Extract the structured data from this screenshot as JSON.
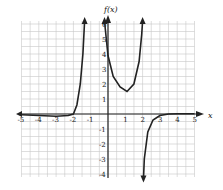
{
  "chart_data": {
    "type": "line",
    "title": "",
    "xlabel": "x",
    "ylabel": "f(x)",
    "xlim": [
      -5,
      5
    ],
    "ylim": [
      -4,
      6
    ],
    "grid": true,
    "x_ticks": [
      "-5",
      "-4",
      "-3",
      "-2",
      "-1",
      "1",
      "2",
      "3",
      "4",
      "5"
    ],
    "y_ticks": [
      "6",
      "5",
      "4",
      "3",
      "2",
      "1",
      "-1",
      "-2",
      "-3",
      "-4"
    ],
    "vertical_asymptotes": [
      -1.3,
      -0.2,
      2
    ],
    "horizontal_asymptote": 0,
    "series": [
      {
        "name": "left branch",
        "x": [
          -5,
          -4,
          -3,
          -2.3,
          -2,
          -1.8,
          -1.6,
          -1.45,
          -1.35
        ],
        "y": [
          -0.05,
          -0.1,
          -0.15,
          -0.1,
          0,
          0.6,
          2,
          4,
          6.2
        ]
      },
      {
        "name": "middle branch",
        "x": [
          -0.2,
          -0.1,
          0,
          0.3,
          0.7,
          1.1,
          1.5,
          1.8,
          1.95,
          2.0
        ],
        "y": [
          6.2,
          5,
          3.9,
          2.5,
          1.8,
          1.5,
          2,
          3.5,
          5.3,
          6.2
        ]
      },
      {
        "name": "right branch",
        "x": [
          2.05,
          2.1,
          2.3,
          2.6,
          3,
          3.5,
          4,
          5
        ],
        "y": [
          -4.3,
          -3,
          -1.2,
          -0.4,
          -0.1,
          0,
          0.02,
          0.02
        ]
      }
    ]
  }
}
